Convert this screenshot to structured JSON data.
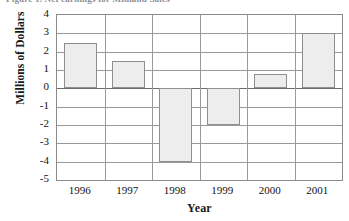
{
  "figure": {
    "title_sliver": "Figure 1. Net earnings for Midland Sales"
  },
  "chart_data": {
    "type": "bar",
    "title": "",
    "xlabel": "Year",
    "ylabel": "Millions of Dollars",
    "categories": [
      "1996",
      "1997",
      "1998",
      "1999",
      "2000",
      "2001"
    ],
    "values": [
      2.5,
      1.5,
      -4.0,
      -2.0,
      0.8,
      3.0
    ],
    "ylim": [
      -5,
      4
    ],
    "ytick_labels": [
      "4",
      "3",
      "2",
      "1",
      "0",
      "-1",
      "-2",
      "-3",
      "-4",
      "-5"
    ],
    "ytick_values": [
      4,
      3,
      2,
      1,
      0,
      -1,
      -2,
      -3,
      -4,
      -5
    ],
    "grid": true,
    "legend": null,
    "bar_fill_color": "#ededed",
    "bar_border_color": "#8f8f8f",
    "grid_color": "#9a9a9a",
    "zero_line_color": "#6d6d6d"
  }
}
